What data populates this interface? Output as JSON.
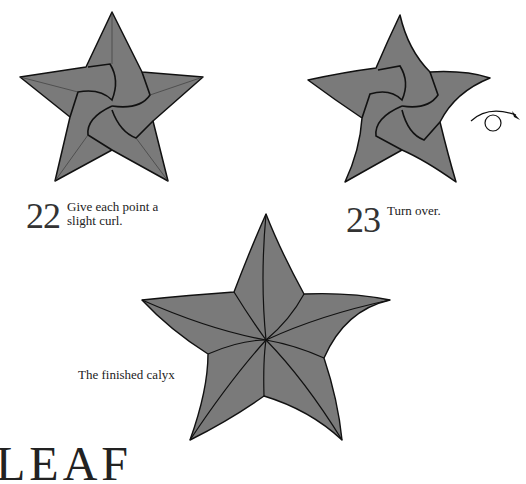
{
  "steps": [
    {
      "number": "22",
      "text_line1": "Give each point a",
      "text_line2": "slight curl."
    },
    {
      "number": "23",
      "text_line1": "Turn over."
    }
  ],
  "final": {
    "caption": "The finished calyx"
  },
  "section_heading": "LEAF",
  "colors": {
    "fill": "#7a7a7a",
    "stroke": "#111111",
    "background": "#ffffff"
  },
  "icons": [
    "star-figure-22",
    "star-figure-23",
    "turn-over-arrow-icon",
    "finished-calyx-figure"
  ]
}
